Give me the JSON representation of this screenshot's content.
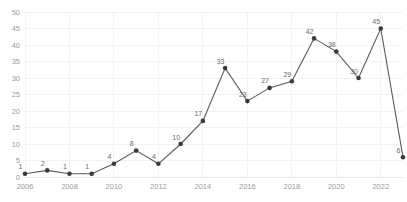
{
  "chart_data": {
    "type": "line",
    "title": "",
    "subtitle": "",
    "xlabel": "",
    "ylabel": "",
    "x": [
      2006,
      2007,
      2008,
      2009,
      2010,
      2011,
      2012,
      2013,
      2014,
      2015,
      2016,
      2017,
      2018,
      2019,
      2020,
      2021,
      2022,
      2023
    ],
    "values": [
      1,
      2,
      1,
      1,
      4,
      8,
      4,
      10,
      17,
      33,
      23,
      27,
      29,
      42,
      38,
      30,
      45,
      6
    ],
    "series": [
      {
        "name": "",
        "values": [
          1,
          2,
          1,
          1,
          4,
          8,
          4,
          10,
          17,
          33,
          23,
          27,
          29,
          42,
          38,
          30,
          45,
          6
        ]
      }
    ],
    "point_labels": [
      "1",
      "2",
      "1",
      "1",
      "4",
      "8",
      "4",
      "10",
      "17",
      "33",
      "23",
      "27",
      "29",
      "42",
      "38",
      "30",
      "45",
      "6"
    ],
    "ylim": [
      0,
      50
    ],
    "xlim": [
      2006,
      2023
    ],
    "y_ticks": [
      0,
      5,
      10,
      15,
      20,
      25,
      30,
      35,
      40,
      45,
      50
    ],
    "y_tick_labels": [
      "0",
      "5",
      "10",
      "15",
      "20",
      "25",
      "30",
      "35",
      "40",
      "45",
      "50"
    ],
    "x_ticks": [
      2006,
      2008,
      2010,
      2012,
      2014,
      2016,
      2018,
      2020,
      2022
    ],
    "x_tick_labels": [
      "2006",
      "2008",
      "2010",
      "2012",
      "2014",
      "2016",
      "2018",
      "2020",
      "2022"
    ],
    "grid": true,
    "grid_axes": "both",
    "legend": false,
    "legend_position": "none",
    "markers": "circle",
    "colors": {
      "line": "#5a5a5a",
      "marker": "#3a3a3a",
      "grid": "#f2f2f2",
      "axis": "#e6e6e6",
      "tick_text": "#9a9a9a",
      "value_text": "#6b6b6b",
      "background": "#ffffff"
    }
  }
}
